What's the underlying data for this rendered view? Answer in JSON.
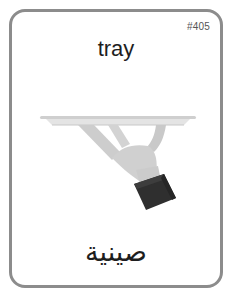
{
  "card": {
    "id_label": "#405",
    "title": "tray",
    "translation": "صينية",
    "translation_language": "Arabic",
    "illustration": "hand-holding-tray-icon",
    "colors": {
      "border": "#8c8c8c",
      "text": "#1e1e1e",
      "id_text": "#555555",
      "tray": "#d9d9d9",
      "hand": "#cfcfcf",
      "sleeve": "#333333"
    }
  }
}
